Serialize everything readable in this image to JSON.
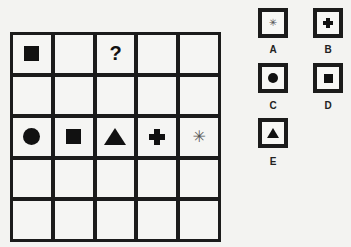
{
  "puzzle": {
    "grid": {
      "rows": 5,
      "cols": 5,
      "cells": [
        [
          "square",
          "",
          "question",
          "",
          ""
        ],
        [
          "",
          "",
          "",
          "",
          ""
        ],
        [
          "circle",
          "square",
          "triangle",
          "plus",
          "asterisk"
        ],
        [
          "",
          "",
          "",
          "",
          ""
        ],
        [
          "",
          "",
          "",
          "",
          ""
        ]
      ],
      "question_mark": "?"
    },
    "options": [
      {
        "label": "A",
        "shape": "asterisk"
      },
      {
        "label": "B",
        "shape": "plus"
      },
      {
        "label": "C",
        "shape": "circle"
      },
      {
        "label": "D",
        "shape": "square"
      },
      {
        "label": "E",
        "shape": "triangle"
      }
    ],
    "asterisk_glyph": "✳"
  }
}
